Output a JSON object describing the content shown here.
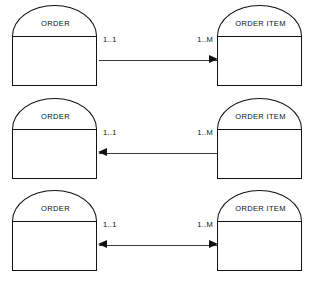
{
  "diagram": {
    "type": "entity-relationship-diagram",
    "entity_left_label": "ORDER",
    "entity_right_label": "ORDER ITEM",
    "cardinality_left": "1..1",
    "cardinality_right": "1..M",
    "line_color": "#3a3a3a",
    "stroke_color": "#111111",
    "background_color": "#ffffff",
    "rows": [
      {
        "id": "row-one-to-many",
        "left_entity": "ORDER",
        "right_entity": "ORDER ITEM",
        "left_cardinality": "1..1",
        "right_cardinality": "1..M",
        "arrow_direction": "right",
        "arrow_head_left": false,
        "arrow_head_right": true
      },
      {
        "id": "row-many-to-one",
        "left_entity": "ORDER",
        "right_entity": "ORDER ITEM",
        "left_cardinality": "1..1",
        "right_cardinality": "1..M",
        "arrow_direction": "left",
        "arrow_head_left": true,
        "arrow_head_right": false
      },
      {
        "id": "row-bidirectional",
        "left_entity": "ORDER",
        "right_entity": "ORDER ITEM",
        "left_cardinality": "1..1",
        "right_cardinality": "1..M",
        "arrow_direction": "both",
        "arrow_head_left": true,
        "arrow_head_right": true
      }
    ]
  }
}
